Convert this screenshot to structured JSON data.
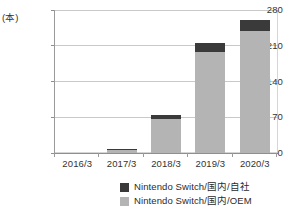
{
  "chart_data": {
    "type": "bar",
    "stacked": true,
    "title": "",
    "subtitle": "",
    "xlabel": "",
    "ylabel": "",
    "unit_label": "(本)",
    "categories": [
      "2016/3",
      "2017/3",
      "2018/3",
      "2019/3",
      "2020/3"
    ],
    "series": [
      {
        "name": "Nintendo Switch/国内/自社",
        "color": "#3a3a3a",
        "values": [
          0,
          2,
          8,
          17,
          22
        ]
      },
      {
        "name": "Nintendo Switch/国内/OEM",
        "color": "#b4b4b4",
        "values": [
          0,
          6,
          67,
          198,
          238
        ]
      }
    ],
    "totals": [
      0,
      8,
      75,
      215,
      260
    ],
    "ylim": [
      0,
      280
    ],
    "yticks": [
      0,
      70,
      140,
      210,
      280
    ],
    "ytick_labels": [
      "0",
      "70",
      "140",
      "210",
      "280"
    ],
    "grid": true,
    "grid_axis": "y",
    "legend_position": "bottom-right"
  },
  "axis": {
    "unit": "(本)",
    "y_ticks": [
      {
        "label": "280",
        "value": 280
      },
      {
        "label": "210",
        "value": 210
      },
      {
        "label": "140",
        "value": 140
      },
      {
        "label": "70",
        "value": 70
      },
      {
        "label": "0",
        "value": 0
      }
    ],
    "x_ticks": [
      {
        "label": "2016/3"
      },
      {
        "label": "2017/3"
      },
      {
        "label": "2018/3"
      },
      {
        "label": "2019/3"
      },
      {
        "label": "2020/3"
      }
    ]
  },
  "legend": {
    "items": [
      {
        "label": "Nintendo Switch/国内/自社",
        "color": "#3a3a3a"
      },
      {
        "label": "Nintendo Switch/国内/OEM",
        "color": "#b4b4b4"
      }
    ]
  }
}
